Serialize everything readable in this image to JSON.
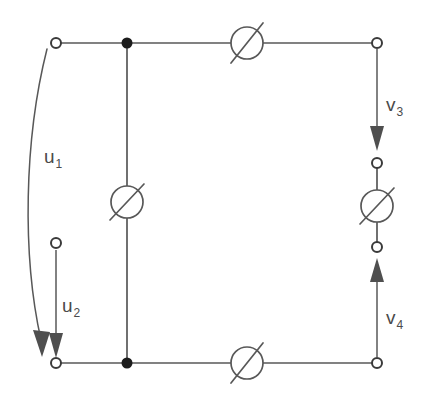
{
  "figure": {
    "name": "electrical-circuit-diagram",
    "type": "circuit-schematic",
    "background_color": "#ffffff",
    "line_color": "#585858",
    "label_color": "#4a4a4a",
    "width": 426,
    "height": 403
  },
  "labels": {
    "u1": {
      "base": "u",
      "sub": "1",
      "text": "u1"
    },
    "u2": {
      "base": "u",
      "sub": "2",
      "text": "u2"
    },
    "v3": {
      "base": "v",
      "sub": "3",
      "text": "v3"
    },
    "v4": {
      "base": "v",
      "sub": "4",
      "text": "v4"
    }
  },
  "terminals": [
    {
      "name": "terminal-top-left",
      "x": 56,
      "y": 43,
      "filled": false
    },
    {
      "name": "terminal-top-right",
      "x": 377,
      "y": 43,
      "filled": false
    },
    {
      "name": "terminal-bottom-left",
      "x": 56,
      "y": 363,
      "filled": false
    },
    {
      "name": "terminal-bottom-right",
      "x": 377,
      "y": 363,
      "filled": false
    },
    {
      "name": "terminal-left-middle",
      "x": 56,
      "y": 243,
      "filled": false
    },
    {
      "name": "terminal-right-upper",
      "x": 377,
      "y": 163,
      "filled": false
    },
    {
      "name": "terminal-right-lower",
      "x": 377,
      "y": 247,
      "filled": false
    }
  ],
  "junctions": [
    {
      "name": "junction-top-center",
      "x": 127,
      "y": 43
    },
    {
      "name": "junction-bottom-center",
      "x": 127,
      "y": 363
    }
  ],
  "elements": [
    {
      "name": "element-top",
      "cx": 247,
      "cy": 43,
      "r": 16,
      "orientation": "horizontal"
    },
    {
      "name": "element-center",
      "cx": 127,
      "cy": 202,
      "r": 16,
      "orientation": "vertical"
    },
    {
      "name": "element-right",
      "cx": 377,
      "cy": 206,
      "r": 16,
      "orientation": "vertical"
    },
    {
      "name": "element-bottom",
      "cx": 247,
      "cy": 363,
      "r": 16,
      "orientation": "horizontal"
    }
  ],
  "arrows": [
    {
      "name": "arrow-u1",
      "style": "curved",
      "direction": "down",
      "from_x": 47,
      "from_y": 49,
      "to_x": 42,
      "to_y": 355
    },
    {
      "name": "arrow-u2",
      "style": "straight",
      "direction": "down",
      "from_x": 56,
      "from_y": 252,
      "to_x": 56,
      "to_y": 355
    },
    {
      "name": "arrow-v3",
      "style": "straight",
      "direction": "down",
      "from_x": 377,
      "from_y": 50,
      "to_x": 377,
      "to_y": 148
    },
    {
      "name": "arrow-v4",
      "style": "straight",
      "direction": "up",
      "from_x": 377,
      "from_y": 356,
      "to_x": 377,
      "to_y": 260
    }
  ]
}
